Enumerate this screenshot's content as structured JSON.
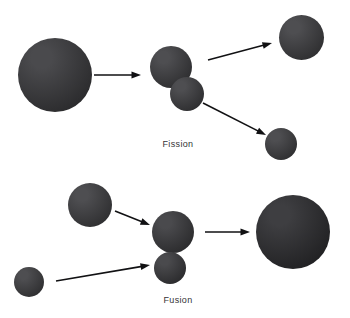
{
  "figure": {
    "title": "",
    "background_color": "#ffffff",
    "width": 350,
    "height": 318
  },
  "processes": [
    {
      "id": "fission",
      "label": "Fission",
      "label_x": 178,
      "label_y": 139,
      "description": "A single large nucleus splits into two smaller nuclei",
      "spheres": [
        {
          "name": "fission-parent-nucleus",
          "role": "parent",
          "cx": 55,
          "cy": 75,
          "d": 74,
          "color_light": "#4a4a4d",
          "color_dark": "#2c2c2e"
        },
        {
          "name": "fission-intermediate-upper-lobe",
          "role": "intermediate",
          "cx": 171,
          "cy": 67,
          "d": 42,
          "color_light": "#4e4e51",
          "color_dark": "#2f2f31"
        },
        {
          "name": "fission-intermediate-lower-lobe",
          "role": "intermediate",
          "cx": 187,
          "cy": 94,
          "d": 34,
          "color_light": "#4e4e51",
          "color_dark": "#2f2f31"
        },
        {
          "name": "fission-product-upper",
          "role": "product",
          "cx": 301,
          "cy": 37,
          "d": 45,
          "color_light": "#4e4e51",
          "color_dark": "#303032"
        },
        {
          "name": "fission-product-lower",
          "role": "product",
          "cx": 281,
          "cy": 144,
          "d": 32,
          "color_light": "#4e4e51",
          "color_dark": "#303032"
        }
      ],
      "arrows": [
        {
          "name": "fission-input-arrow",
          "x1": 94,
          "y1": 75,
          "x2": 141,
          "y2": 75
        },
        {
          "name": "fission-split-arrow-up",
          "x1": 208,
          "y1": 60,
          "x2": 272,
          "y2": 43
        },
        {
          "name": "fission-split-arrow-down",
          "x1": 203,
          "y1": 103,
          "x2": 266,
          "y2": 135
        }
      ]
    },
    {
      "id": "fusion",
      "label": "Fusion",
      "label_x": 178,
      "label_y": 295,
      "description": "Two small nuclei combine into one larger nucleus",
      "spheres": [
        {
          "name": "fusion-reactant-upper",
          "role": "reactant",
          "cx": 90,
          "cy": 205,
          "d": 44,
          "color_light": "#4e4e51",
          "color_dark": "#303032"
        },
        {
          "name": "fusion-reactant-lower",
          "role": "reactant",
          "cx": 29,
          "cy": 282,
          "d": 30,
          "color_light": "#4e4e51",
          "color_dark": "#303032"
        },
        {
          "name": "fusion-intermediate-upper-lobe",
          "role": "intermediate",
          "cx": 173,
          "cy": 232,
          "d": 42,
          "color_light": "#4a4a4d",
          "color_dark": "#2c2c2e"
        },
        {
          "name": "fusion-intermediate-lower-lobe",
          "role": "intermediate",
          "cx": 170,
          "cy": 268,
          "d": 32,
          "color_light": "#4a4a4d",
          "color_dark": "#2c2c2e"
        },
        {
          "name": "fusion-product-nucleus",
          "role": "product",
          "cx": 293,
          "cy": 232,
          "d": 74,
          "color_light": "#3e3e41",
          "color_dark": "#222224"
        }
      ],
      "arrows": [
        {
          "name": "fusion-input-arrow-upper",
          "x1": 115,
          "y1": 211,
          "x2": 150,
          "y2": 225
        },
        {
          "name": "fusion-input-arrow-lower",
          "x1": 56,
          "y1": 281,
          "x2": 150,
          "y2": 265
        },
        {
          "name": "fusion-output-arrow",
          "x1": 205,
          "y1": 232,
          "x2": 250,
          "y2": 232
        }
      ]
    }
  ],
  "style": {
    "arrow_color": "#111113",
    "arrow_width": 1.6,
    "label_color": "#333335"
  }
}
